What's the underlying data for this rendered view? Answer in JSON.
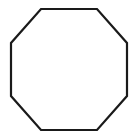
{
  "canvas": {
    "width": 138,
    "height": 139,
    "background_color": "#ffffff",
    "title": "Octagon line drawing"
  },
  "shape": {
    "name": "octagon",
    "sides": 8,
    "type": "regular polygon",
    "fill_color": "#ffffff",
    "stroke_color": "#1a1a1a",
    "stroke_width": 2.2,
    "bounding_box": {
      "left": 11,
      "top": 9,
      "right": 127,
      "bottom": 130,
      "width": 116,
      "height": 121
    },
    "points": "41,9 97,9 127,43 127,96 97,130 41,130 11,96 11,43",
    "vertices": [
      {
        "label": "top-left",
        "x": 41,
        "y": 9
      },
      {
        "label": "top-right",
        "x": 97,
        "y": 9
      },
      {
        "label": "right-top",
        "x": 127,
        "y": 43
      },
      {
        "label": "right-bottom",
        "x": 127,
        "y": 96
      },
      {
        "label": "bottom-right",
        "x": 97,
        "y": 130
      },
      {
        "label": "bottom-left",
        "x": 41,
        "y": 130
      },
      {
        "label": "left-bottom",
        "x": 11,
        "y": 96
      },
      {
        "label": "left-top",
        "x": 11,
        "y": 43
      }
    ]
  }
}
